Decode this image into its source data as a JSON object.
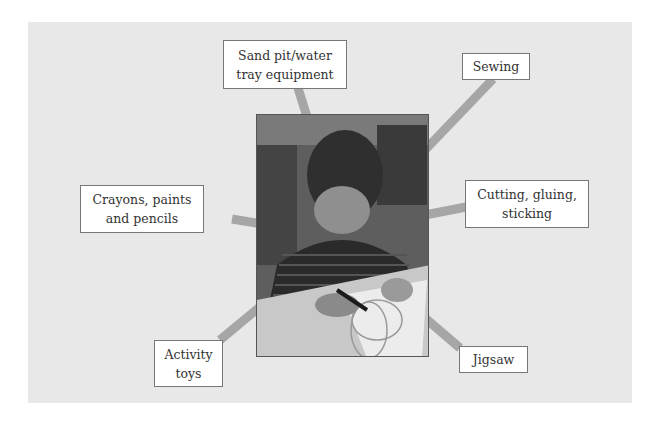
{
  "diagram": {
    "center": {
      "image_alt": "Photo of a young boy drawing with a crayon on paper at a table"
    },
    "labels": [
      {
        "id": "sand-pit",
        "text": "Sand pit/water tray equipment"
      },
      {
        "id": "sewing",
        "text": "Sewing"
      },
      {
        "id": "crayons",
        "text": "Crayons, paints and pencils"
      },
      {
        "id": "cutting",
        "text": "Cutting, gluing, sticking"
      },
      {
        "id": "activity",
        "text": "Activity toys"
      },
      {
        "id": "jigsaw",
        "text": "Jigsaw"
      }
    ],
    "colors": {
      "panel": "#e8e8e8",
      "spoke": "#a6a6a6",
      "box_border": "#777777"
    }
  }
}
